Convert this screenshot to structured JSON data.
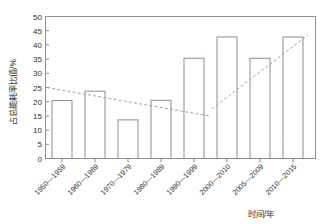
{
  "chart_data": {
    "type": "bar",
    "title": "",
    "subtitle": "",
    "xlabel": "时间/年",
    "ylabel": "占总能耗率比值/%",
    "categories": [
      "1950—1959",
      "1960—1969",
      "1970—1979",
      "1980—1989",
      "1990—1999",
      "2000—2010",
      "2005—2009",
      "2010—2015"
    ],
    "values": [
      17.3,
      24.4,
      20.4,
      23.7,
      13.6,
      20.5,
      35.3,
      42.8
    ],
    "series": [
      {
        "name": "占总能耗率比值",
        "values": [
          17.3,
          24.4,
          20.4,
          23.7,
          13.6,
          20.5,
          35.3,
          42.8
        ]
      }
    ],
    "ylim": [
      0,
      50
    ],
    "ytick_labels": [
      "0",
      "5",
      "10",
      "15",
      "20",
      "25",
      "30",
      "35",
      "40",
      "45",
      "50"
    ],
    "ytick_values": [
      0,
      5,
      10,
      15,
      20,
      25,
      30,
      35,
      40,
      45,
      50
    ],
    "grid": false,
    "legend": "none",
    "bar_fill": "#ffffff",
    "bar_stroke": "#8d8d8d",
    "axis_color": "#8a8a8a",
    "trend_color": "#a2a2a2",
    "annotations": [
      {
        "name": "declining-trend-line",
        "style": "dashed",
        "from_category_index": 0,
        "to_category_index": 4,
        "from_value": 25.0,
        "to_value": 15.0
      },
      {
        "name": "rising-trend-line",
        "style": "dashed",
        "from_category_index": 5,
        "to_category_index": 7,
        "from_value": 17.5,
        "to_value": 43.5
      }
    ]
  },
  "axes": {
    "y_title": "占总能耗率比值/%",
    "x_title": "时间/年",
    "y_ticks": [
      "0",
      "5",
      "10",
      "15",
      "20",
      "25",
      "30",
      "35",
      "40",
      "45",
      "50"
    ],
    "x_ticks": [
      "1950—1959",
      "1960—1969",
      "1970—1979",
      "1980—1989",
      "1990—1999",
      "2000—2010",
      "2005—2009",
      "2010—2015"
    ]
  }
}
